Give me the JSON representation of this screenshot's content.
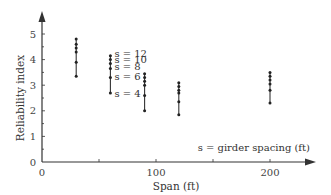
{
  "chart_data": {
    "type": "scatter",
    "title": "",
    "xlabel": "Span (ft)",
    "ylabel": "Reliability index",
    "xlim": [
      0,
      240
    ],
    "ylim": [
      0,
      5.5
    ],
    "x_ticks": [
      0,
      100,
      200
    ],
    "x_minor_ticks": [
      50,
      150
    ],
    "y_ticks": [
      0,
      1,
      2,
      3,
      4,
      5
    ],
    "grid": false,
    "legend": null,
    "annotation": "s = girder spacing (ft)",
    "series_labels": [
      {
        "label": "s = 12",
        "value": 4.15
      },
      {
        "label": "s = 10",
        "value": 3.95
      },
      {
        "label": "s = 8",
        "value": 3.7
      },
      {
        "label": "s = 6",
        "value": 3.3
      },
      {
        "label": "s = 4",
        "value": 2.7
      }
    ],
    "x": [
      30,
      60,
      90,
      120,
      200
    ],
    "series": [
      {
        "name": "s = 12",
        "values": [
          4.8,
          4.15,
          3.45,
          3.1,
          3.5
        ]
      },
      {
        "name": "s = 10",
        "values": [
          4.6,
          4.0,
          3.3,
          2.95,
          3.35
        ]
      },
      {
        "name": "s = 8",
        "values": [
          4.45,
          3.85,
          3.15,
          2.8,
          3.2
        ]
      },
      {
        "name": "s = 6",
        "values": [
          4.3,
          3.65,
          3.0,
          2.7,
          3.05
        ]
      },
      {
        "name": "s = 5",
        "values": [
          3.9,
          3.3,
          2.6,
          2.35,
          2.8
        ]
      },
      {
        "name": "s = 4",
        "values": [
          3.35,
          2.7,
          2.0,
          1.85,
          2.3
        ]
      }
    ]
  },
  "labels": {
    "xlabel": "Span (ft)",
    "ylabel": "Reliability index",
    "annotation": "s = girder spacing (ft)",
    "origin_y": "0",
    "origin_x": "0"
  }
}
